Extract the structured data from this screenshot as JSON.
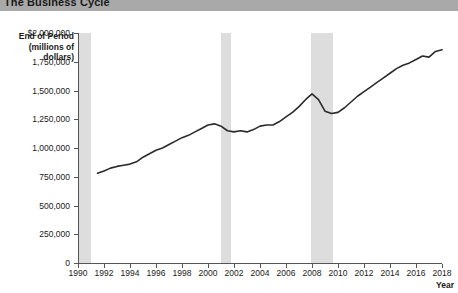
{
  "title": "The Business Cycle",
  "axis": {
    "y_title_lines": [
      "End of Period",
      "(millions of",
      "dollars)"
    ],
    "x_title": "Year"
  },
  "chart_data": {
    "type": "line",
    "title": "The Business Cycle",
    "xlabel": "Year",
    "ylabel": "End of Period (millions of dollars)",
    "xlim": [
      1990,
      2018
    ],
    "ylim": [
      0,
      2000000
    ],
    "grid": false,
    "legend": "none",
    "ytick_labels": [
      "$2,000,000",
      "1,750,000",
      "1,500,000",
      "1,250,000",
      "1,000,000",
      "750,000",
      "500,000",
      "250,000",
      "0"
    ],
    "ytick_values": [
      2000000,
      1750000,
      1500000,
      1250000,
      1000000,
      750000,
      500000,
      250000,
      0
    ],
    "xtick_labels": [
      "1990",
      "1992",
      "1994",
      "1996",
      "1998",
      "2000",
      "2002",
      "2004",
      "2006",
      "2008",
      "2010",
      "2012",
      "2014",
      "2016",
      "2018"
    ],
    "xtick_values": [
      1990,
      1992,
      1994,
      1996,
      1998,
      2000,
      2002,
      2004,
      2006,
      2008,
      2010,
      2012,
      2014,
      2016,
      2018
    ],
    "series": [
      {
        "name": "End of Period",
        "color": "#2b2b2b",
        "x": [
          1991.5,
          1992.0,
          1992.5,
          1993.0,
          1993.5,
          1994.0,
          1994.5,
          1995.0,
          1995.5,
          1996.0,
          1996.5,
          1997.0,
          1997.5,
          1998.0,
          1998.5,
          1999.0,
          1999.5,
          2000.0,
          2000.5,
          2001.0,
          2001.5,
          2002.0,
          2002.5,
          2003.0,
          2003.5,
          2004.0,
          2004.5,
          2005.0,
          2005.5,
          2006.0,
          2006.5,
          2007.0,
          2007.5,
          2008.0,
          2008.5,
          2009.0,
          2009.5,
          2010.0,
          2010.5,
          2011.0,
          2011.5,
          2012.0,
          2012.5,
          2013.0,
          2013.5,
          2014.0,
          2014.5,
          2015.0,
          2015.5,
          2016.0,
          2016.5,
          2017.0,
          2017.5,
          2018.0
        ],
        "y": [
          780000,
          800000,
          825000,
          840000,
          850000,
          860000,
          880000,
          920000,
          950000,
          980000,
          1000000,
          1030000,
          1060000,
          1090000,
          1110000,
          1140000,
          1170000,
          1200000,
          1210000,
          1190000,
          1150000,
          1140000,
          1150000,
          1140000,
          1160000,
          1190000,
          1200000,
          1200000,
          1230000,
          1270000,
          1310000,
          1360000,
          1420000,
          1470000,
          1420000,
          1320000,
          1300000,
          1310000,
          1350000,
          1400000,
          1450000,
          1490000,
          1530000,
          1570000,
          1610000,
          1650000,
          1690000,
          1720000,
          1740000,
          1770000,
          1800000,
          1790000,
          1840000,
          1855000
        ]
      }
    ],
    "recession_bands": [
      {
        "label": "1990-1991 recession",
        "start": 1990.0,
        "end": 1991.0,
        "color": "#dddddd"
      },
      {
        "label": "2001 recession",
        "start": 2001.0,
        "end": 2001.8,
        "color": "#dddddd"
      },
      {
        "label": "2008-2009 recession",
        "start": 2007.9,
        "end": 2009.6,
        "color": "#dddddd"
      }
    ]
  }
}
